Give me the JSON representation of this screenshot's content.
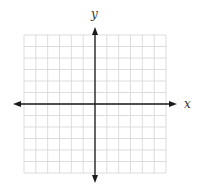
{
  "diagram": {
    "type": "coordinate-plane",
    "axes": {
      "x_label": "x",
      "y_label": "y",
      "color": "#1a1a1a"
    },
    "grid": {
      "columns": 12,
      "rows": 12,
      "color": "#d4d4d4"
    }
  }
}
